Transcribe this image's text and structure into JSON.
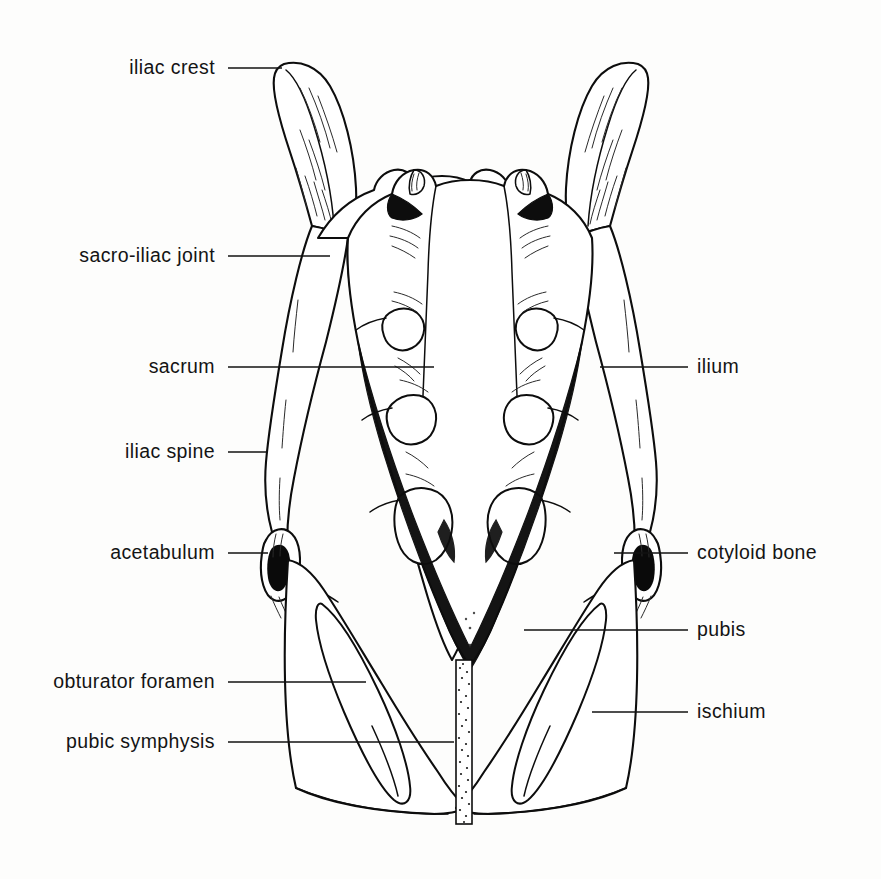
{
  "figure": {
    "background_color": "#fdfdfc",
    "ink_color": "#0d0d0d",
    "width": 881,
    "height": 879
  },
  "labels": {
    "left": [
      {
        "id": "iliac-crest",
        "text": "iliac crest",
        "text_x": 215,
        "y": 68,
        "leader_x1": 228,
        "leader_x2": 282
      },
      {
        "id": "sacro-iliac-joint",
        "text": "sacro-iliac joint",
        "text_x": 215,
        "y": 256,
        "leader_x1": 228,
        "leader_x2": 330
      },
      {
        "id": "sacrum",
        "text": "sacrum",
        "text_x": 215,
        "y": 367,
        "leader_x1": 228,
        "leader_x2": 434
      },
      {
        "id": "iliac-spine",
        "text": "iliac spine",
        "text_x": 215,
        "y": 452,
        "leader_x1": 228,
        "leader_x2": 268
      },
      {
        "id": "acetabulum",
        "text": "acetabulum",
        "text_x": 215,
        "y": 553,
        "leader_x1": 228,
        "leader_x2": 268
      },
      {
        "id": "obturator-foramen",
        "text": "obturator foramen",
        "text_x": 215,
        "y": 682,
        "leader_x1": 228,
        "leader_x2": 366
      },
      {
        "id": "pubic-symphysis",
        "text": "pubic symphysis",
        "text_x": 215,
        "y": 742,
        "leader_x1": 228,
        "leader_x2": 454
      }
    ],
    "right": [
      {
        "id": "ilium",
        "text": "ilium",
        "text_x": 697,
        "y": 367,
        "leader_x1": 600,
        "leader_x2": 688
      },
      {
        "id": "cotyloid-bone",
        "text": "cotyloid bone",
        "text_x": 697,
        "y": 553,
        "leader_x1": 614,
        "leader_x2": 688
      },
      {
        "id": "pubis",
        "text": "pubis",
        "text_x": 697,
        "y": 630,
        "leader_x1": 524,
        "leader_x2": 688
      },
      {
        "id": "ischium",
        "text": "ischium",
        "text_x": 697,
        "y": 712,
        "leader_x1": 592,
        "leader_x2": 688
      }
    ]
  },
  "anatomy": {
    "structures": [
      "iliac crest",
      "sacro-iliac joint",
      "sacrum",
      "iliac spine",
      "acetabulum",
      "obturator foramen",
      "pubic symphysis",
      "ilium",
      "cotyloid bone",
      "pubis",
      "ischium"
    ],
    "sacral_foramina_pairs": 3,
    "view": "dorsal"
  }
}
